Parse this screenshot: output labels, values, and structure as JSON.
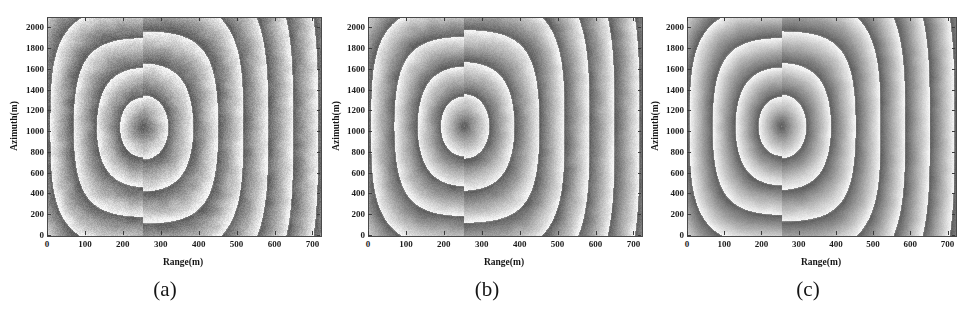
{
  "figure": {
    "background_color": "#ffffff",
    "panel_count": 3
  },
  "axes": {
    "xlabel": "Range(m)",
    "ylabel": "Azimuth(m)",
    "xticks": [
      "0",
      "100",
      "200",
      "300",
      "400",
      "500",
      "600",
      "700"
    ],
    "yticks": [
      "0",
      "200",
      "400",
      "600",
      "800",
      "1000",
      "1200",
      "1400",
      "1600",
      "1800",
      "2000"
    ]
  },
  "captions": {
    "a": "(a)",
    "b": "(b)",
    "c": "(c)"
  },
  "chart_data": {
    "type": "heatmap",
    "title": "",
    "xlabel": "Range(m)",
    "ylabel": "Azimuth(m)",
    "xlim": [
      0,
      720
    ],
    "ylim": [
      2100,
      0
    ],
    "xticks": [
      0,
      100,
      200,
      300,
      400,
      500,
      600,
      700
    ],
    "yticks": [
      0,
      200,
      400,
      600,
      800,
      1000,
      1200,
      1400,
      1600,
      1800,
      2000
    ],
    "grid": false,
    "legend": "none",
    "colormap": "gray",
    "value_range": [
      -3.1416,
      3.1416
    ],
    "panels": [
      {
        "label": "(a)",
        "center_range_m": 250,
        "center_azimuth_m": 1050,
        "fringe_count": 9,
        "noise_level": 0.16
      },
      {
        "label": "(b)",
        "center_range_m": 250,
        "center_azimuth_m": 1060,
        "fringe_count": 9,
        "noise_level": 0.11
      },
      {
        "label": "(c)",
        "center_range_m": 250,
        "center_azimuth_m": 1060,
        "fringe_count": 9,
        "noise_level": 0.07
      }
    ]
  }
}
